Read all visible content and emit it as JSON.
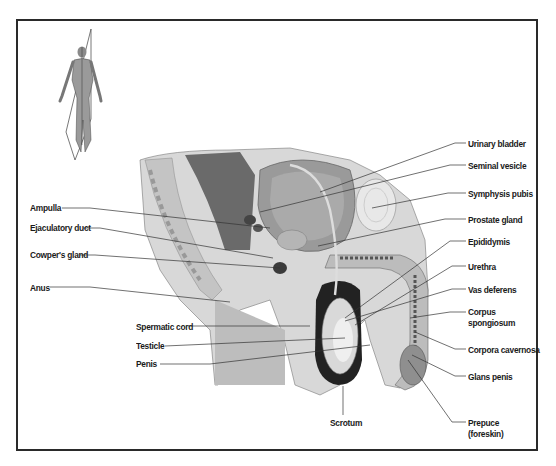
{
  "diagram": {
    "orientation_figure": "human-figure-with-sagittal-plane",
    "labels_left": [
      {
        "id": "ampulla",
        "text": "Ampulla",
        "x": 30,
        "y": 203
      },
      {
        "id": "ejaculatory-duct",
        "text": "Ejaculatory duct",
        "x": 30,
        "y": 223
      },
      {
        "id": "cowpers-gland",
        "text": "Cowper's gland",
        "x": 30,
        "y": 250
      },
      {
        "id": "anus",
        "text": "Anus",
        "x": 30,
        "y": 283
      },
      {
        "id": "spermatic-cord",
        "text": "Spermatic cord",
        "x": 136,
        "y": 322
      },
      {
        "id": "testicle",
        "text": "Testicle",
        "x": 136,
        "y": 341
      },
      {
        "id": "penis",
        "text": "Penis",
        "x": 136,
        "y": 359
      }
    ],
    "labels_right": [
      {
        "id": "urinary-bladder",
        "text": "Urinary bladder",
        "x": 468,
        "y": 139
      },
      {
        "id": "seminal-vesicle",
        "text": "Seminal vesicle",
        "x": 468,
        "y": 161
      },
      {
        "id": "symphysis-pubis",
        "text": "Symphysis pubis",
        "x": 468,
        "y": 189
      },
      {
        "id": "prostate-gland",
        "text": "Prostate gland",
        "x": 468,
        "y": 215
      },
      {
        "id": "epididymis",
        "text": "Epididymis",
        "x": 468,
        "y": 237
      },
      {
        "id": "urethra",
        "text": "Urethra",
        "x": 468,
        "y": 262
      },
      {
        "id": "vas-deferens",
        "text": "Vas deferens",
        "x": 468,
        "y": 285
      },
      {
        "id": "corpus-spongiosum",
        "text": "Corpus\nspongiosum",
        "x": 468,
        "y": 308
      },
      {
        "id": "corpora-cavernosa",
        "text": "Corpora cavernosa",
        "x": 468,
        "y": 345
      },
      {
        "id": "glans-penis",
        "text": "Glans penis",
        "x": 468,
        "y": 372
      },
      {
        "id": "prepuce",
        "text": "Prepuce\n(foreskin)",
        "x": 468,
        "y": 418
      }
    ],
    "labels_bottom": [
      {
        "id": "scrotum",
        "text": "Scrotum",
        "x": 343,
        "y": 418
      }
    ]
  }
}
